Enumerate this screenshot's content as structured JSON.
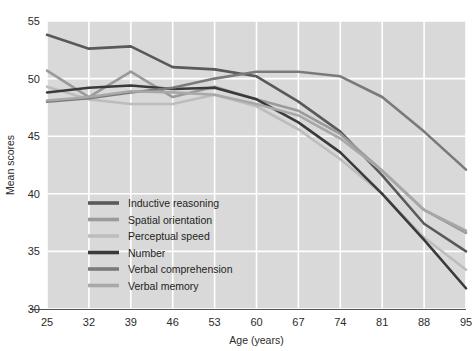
{
  "chart_data": {
    "type": "line",
    "title": "",
    "xlabel": "Age (years)",
    "ylabel": "Mean scores",
    "x": [
      25,
      32,
      39,
      46,
      53,
      60,
      67,
      74,
      81,
      88,
      95
    ],
    "xticks": [
      "25",
      "32",
      "39",
      "46",
      "53",
      "60",
      "67",
      "74",
      "81",
      "88",
      "95"
    ],
    "yticks": [
      "30",
      "35",
      "40",
      "45",
      "50",
      "55"
    ],
    "xlim": [
      25,
      95
    ],
    "ylim": [
      30,
      55
    ],
    "grid": true,
    "legend_position": "lower-left-inside",
    "plot_background": "#d9d9d9",
    "grid_color": "#ffffff",
    "series": [
      {
        "name": "Inductive reasoning",
        "color": "#595959",
        "values": [
          53.8,
          52.6,
          52.8,
          51.0,
          50.8,
          50.2,
          48.0,
          45.4,
          41.6,
          37.4,
          35.0
        ]
      },
      {
        "name": "Spatial orientation",
        "color": "#9a9a9a",
        "values": [
          50.7,
          48.4,
          50.6,
          48.4,
          49.3,
          48.2,
          47.2,
          45.2,
          42.0,
          38.6,
          36.6
        ]
      },
      {
        "name": "Perceptual speed",
        "color": "#bdbdbd",
        "values": [
          49.3,
          48.2,
          47.8,
          47.8,
          48.6,
          47.6,
          45.6,
          43.0,
          40.0,
          36.2,
          33.4
        ]
      },
      {
        "name": "Number",
        "color": "#3a3a3a",
        "values": [
          48.8,
          49.2,
          49.4,
          49.1,
          49.2,
          48.2,
          46.2,
          43.6,
          40.0,
          36.0,
          31.8
        ]
      },
      {
        "name": "Verbal comprehension",
        "color": "#7a7a7a",
        "values": [
          48.0,
          48.3,
          48.8,
          49.2,
          50.0,
          50.6,
          50.6,
          50.2,
          48.4,
          45.4,
          42.1
        ]
      },
      {
        "name": "Verbal memory",
        "color": "#a8a8a8",
        "values": [
          48.1,
          48.4,
          48.9,
          48.8,
          48.6,
          47.8,
          46.8,
          44.8,
          42.0,
          38.6,
          36.8
        ]
      }
    ]
  },
  "legend": {
    "items": [
      {
        "label": "Inductive reasoning",
        "color": "#595959"
      },
      {
        "label": "Spatial orientation",
        "color": "#9a9a9a"
      },
      {
        "label": "Perceptual speed",
        "color": "#bdbdbd"
      },
      {
        "label": "Number",
        "color": "#3a3a3a"
      },
      {
        "label": "Verbal comprehension",
        "color": "#7a7a7a"
      },
      {
        "label": "Verbal memory",
        "color": "#a8a8a8"
      }
    ]
  },
  "axes": {
    "x_title": "Age (years)",
    "y_title": "Mean scores"
  }
}
